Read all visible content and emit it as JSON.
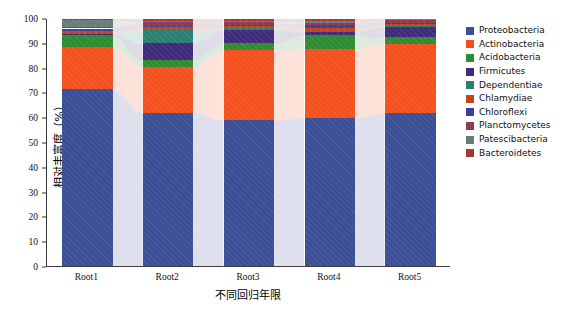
{
  "chart_data": {
    "type": "bar",
    "subtype": "stacked-percentage",
    "title": "",
    "xlabel": "不同回归年限",
    "ylabel": "相对丰富度（%）",
    "categories": [
      "Root1",
      "Root2",
      "Root3",
      "Root4",
      "Root5"
    ],
    "ylim": [
      0,
      100
    ],
    "yticks": [
      0,
      10,
      20,
      30,
      40,
      50,
      60,
      70,
      80,
      90,
      100
    ],
    "ytick_labels": [
      "0",
      "10",
      "20",
      "30",
      "40",
      "50",
      "60",
      "70",
      "80",
      "90",
      "100"
    ],
    "grid": false,
    "legend_position": "right",
    "stack_order_bottom_to_top": [
      "Proteobacteria",
      "Actinobacteria",
      "Acidobacteria",
      "Firmicutes",
      "Dependentiae",
      "Chlamydiae",
      "Chloroflexi",
      "Planctomycetes",
      "Patescibacteria",
      "Bacteroidetes"
    ],
    "series": [
      {
        "name": "Proteobacteria",
        "color": "#3b4f95",
        "values": [
          69.2,
          58.8,
          57.0,
          55.5,
          59.8
        ]
      },
      {
        "name": "Actinobacteria",
        "color": "#f4511e",
        "values": [
          16.4,
          17.6,
          27.5,
          26.0,
          27.2
        ]
      },
      {
        "name": "Acidobacteria",
        "color": "#2f8b2f",
        "values": [
          4.6,
          2.6,
          2.8,
          5.2,
          2.4
        ]
      },
      {
        "name": "Firmicutes",
        "color": "#3f2b7a",
        "values": [
          0.6,
          6.5,
          5.2,
          1.1,
          4.2
        ]
      },
      {
        "name": "Dependentiae",
        "color": "#2a7f72",
        "values": [
          0.5,
          4.9,
          0.5,
          0.5,
          0.5
        ]
      },
      {
        "name": "Chlamydiae",
        "color": "#c4441c",
        "values": [
          0.7,
          1.0,
          0.7,
          1.1,
          0.5
        ]
      },
      {
        "name": "Chloroflexi",
        "color": "#3c3f9c",
        "values": [
          0.9,
          0.6,
          0.6,
          0.8,
          0.6
        ]
      },
      {
        "name": "Planctomycetes",
        "color": "#8e3a52",
        "values": [
          0.7,
          1.3,
          1.0,
          1.0,
          0.9
        ]
      },
      {
        "name": "Patescibacteria",
        "color": "#6b7b79",
        "values": [
          2.6,
          0.5,
          0.5,
          0.5,
          0.5
        ]
      },
      {
        "name": "Bacteroidetes",
        "color": "#a23a32",
        "values": [
          0.8,
          1.2,
          1.2,
          1.3,
          0.4
        ]
      }
    ]
  },
  "legend": {
    "items": [
      {
        "label": "Proteobacteria",
        "color": "#3b4f95"
      },
      {
        "label": "Actinobacteria",
        "color": "#f4511e"
      },
      {
        "label": "Acidobacteria",
        "color": "#2f8b2f"
      },
      {
        "label": "Firmicutes",
        "color": "#3f2b7a"
      },
      {
        "label": "Dependentiae",
        "color": "#2a7f72"
      },
      {
        "label": "Chlamydiae",
        "color": "#c4441c"
      },
      {
        "label": "Chloroflexi",
        "color": "#3c3f9c"
      },
      {
        "label": "Planctomycetes",
        "color": "#8e3a52"
      },
      {
        "label": "Patescibacteria",
        "color": "#6b7b79"
      },
      {
        "label": "Bacteroidetes",
        "color": "#a23a32"
      }
    ]
  }
}
